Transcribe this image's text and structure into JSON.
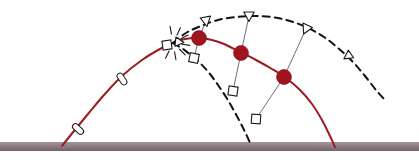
{
  "figure": {
    "background_color": "#ffffff",
    "width": 419,
    "height": 164
  },
  "colors": {
    "red_trajectory": "#9b1b22",
    "red_marker_fill": "#a01420",
    "dashed_trajectory": "#121212",
    "connector_line": "#6f6f78",
    "ground_fill": "#8e7a80",
    "ground_top_highlight": "#a3939a",
    "ground_bottom_shadow": "#796067",
    "marker_outline": "#1a1a1a",
    "marker_face": "#ffffff",
    "burst_ray": "#1a1a1a"
  },
  "ground": {
    "name": "ground-line",
    "x": 0,
    "y": 142,
    "width": 419,
    "height": 9,
    "label": "ground"
  },
  "burst": {
    "name": "explosion-burst",
    "center_x": 173,
    "center_y": 43,
    "ray_count": 10,
    "ray_inner_radius": 9,
    "ray_outer_radius": 17,
    "label": "explosion point"
  },
  "chart_data": {
    "type": "line",
    "xlabel": "",
    "ylabel": "",
    "xlim": [
      0,
      419
    ],
    "ylim": [
      164,
      0
    ],
    "grid": false,
    "legend": "none",
    "series": [
      {
        "name": "red-main-trajectory",
        "style": "solid",
        "color": "#9b1b22",
        "width": 2.0,
        "points": [
          [
            62,
            146
          ],
          [
            74,
            131
          ],
          [
            88,
            114
          ],
          [
            104,
            95
          ],
          [
            122,
            76
          ],
          [
            142,
            60
          ],
          [
            160,
            49
          ],
          [
            173,
            43
          ]
        ]
      },
      {
        "name": "red-fragment-trajectory",
        "style": "solid",
        "color": "#9b1b22",
        "width": 2.0,
        "points": [
          [
            173,
            43
          ],
          [
            185,
            39
          ],
          [
            199,
            38
          ],
          [
            212,
            40
          ],
          [
            224,
            44
          ],
          [
            240,
            52
          ],
          [
            256,
            60
          ],
          [
            272,
            69
          ],
          [
            286,
            78
          ],
          [
            300,
            90
          ],
          [
            312,
            104
          ],
          [
            322,
            120
          ],
          [
            330,
            136
          ],
          [
            335,
            147
          ]
        ]
      },
      {
        "name": "upper-dashed-trajectory",
        "style": "dashed",
        "color": "#121212",
        "width": 2.0,
        "dash": "7,5",
        "points": [
          [
            173,
            43
          ],
          [
            186,
            33
          ],
          [
            201,
            26
          ],
          [
            218,
            20
          ],
          [
            236,
            17
          ],
          [
            254,
            16
          ],
          [
            272,
            17
          ],
          [
            290,
            21
          ],
          [
            308,
            28
          ],
          [
            324,
            37
          ],
          [
            338,
            48
          ],
          [
            352,
            61
          ],
          [
            365,
            76
          ],
          [
            376,
            90
          ],
          [
            385,
            100
          ]
        ]
      },
      {
        "name": "lower-dashed-trajectory",
        "style": "dashed",
        "color": "#121212",
        "width": 2.0,
        "dash": "7,5",
        "points": [
          [
            173,
            43
          ],
          [
            183,
            49
          ],
          [
            192,
            56
          ],
          [
            201,
            64
          ],
          [
            210,
            74
          ],
          [
            218,
            85
          ],
          [
            226,
            97
          ],
          [
            233,
            109
          ],
          [
            240,
            122
          ],
          [
            246,
            134
          ],
          [
            251,
            145
          ]
        ]
      }
    ],
    "connector_lines": [
      {
        "name": "connector-1",
        "color": "#6f6f78",
        "from": [
          206,
          21
        ],
        "via": [
          199,
          38
        ],
        "to": [
          194,
          58
        ]
      },
      {
        "name": "connector-2",
        "color": "#6f6f78",
        "from": [
          249,
          16
        ],
        "via": [
          241,
          53
        ],
        "to": [
          233,
          91
        ]
      },
      {
        "name": "connector-3",
        "color": "#6f6f78",
        "from": [
          306,
          29
        ],
        "via": [
          284,
          77
        ],
        "to": [
          256,
          119
        ]
      }
    ],
    "markers": [
      {
        "name": "fragment-dot-1",
        "type": "filled-circle",
        "color": "#a01420",
        "x": 199,
        "y": 38,
        "r": 7.5
      },
      {
        "name": "fragment-dot-2",
        "type": "filled-circle",
        "color": "#a01420",
        "x": 241,
        "y": 53,
        "r": 7.5
      },
      {
        "name": "fragment-dot-3",
        "type": "filled-circle",
        "color": "#a01420",
        "x": 284,
        "y": 77,
        "r": 7.5
      },
      {
        "name": "projectile-marker-1",
        "type": "capsule",
        "x": 78,
        "y": 129,
        "angle": -47,
        "w": 6,
        "h": 13
      },
      {
        "name": "projectile-marker-2",
        "type": "capsule",
        "x": 122,
        "y": 79,
        "angle": -33,
        "w": 6,
        "h": 13
      },
      {
        "name": "burst-square",
        "type": "square",
        "x": 167,
        "y": 45,
        "size": 9,
        "angle": -8
      },
      {
        "name": "burst-triangle",
        "type": "triangle",
        "x": 179,
        "y": 42,
        "size": 8,
        "angle": 96
      },
      {
        "name": "upper-tri-1",
        "type": "triangle",
        "x": 206,
        "y": 21,
        "size": 9,
        "angle": 170
      },
      {
        "name": "upper-tri-2",
        "type": "triangle",
        "x": 249,
        "y": 16,
        "size": 9,
        "angle": 180
      },
      {
        "name": "upper-tri-3",
        "type": "triangle",
        "x": 306,
        "y": 29,
        "size": 9,
        "angle": 205
      },
      {
        "name": "upper-tri-4",
        "type": "triangle",
        "x": 348,
        "y": 56,
        "size": 8,
        "angle": 235
      },
      {
        "name": "lower-sq-1",
        "type": "square",
        "x": 194,
        "y": 58,
        "size": 9,
        "angle": 12
      },
      {
        "name": "lower-sq-2",
        "type": "square",
        "x": 233,
        "y": 91,
        "size": 9,
        "angle": 8
      },
      {
        "name": "lower-sq-3",
        "type": "square",
        "x": 256,
        "y": 119,
        "size": 9,
        "angle": 4
      }
    ]
  }
}
